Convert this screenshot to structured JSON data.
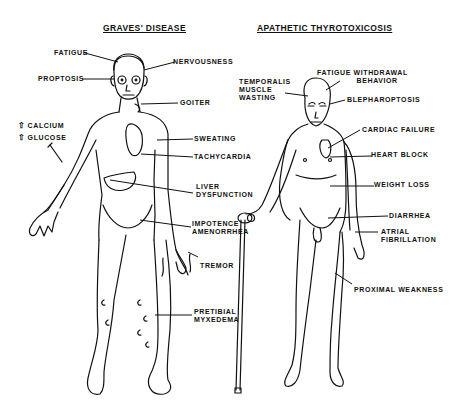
{
  "figures": [
    {
      "title": "GRAVES' DISEASE",
      "labels": {
        "fatigue": "FATIGUE",
        "nervousness": "NERVOUSNESS",
        "proptosis": "PROPTOSIS",
        "goiter": "GOITER",
        "calcium": "CALCIUM",
        "glucose": "GLUCOSE",
        "sweating": "SWEATING",
        "tachycardia": "TACHYCARDIA",
        "liver_1": "LIVER",
        "liver_2": "DYSFUNCTION",
        "impotence": "IMPOTENCE",
        "amenorrhea": "AMENORRHEA",
        "tremor": "TREMOR",
        "pretibial_1": "PRETIBIAL",
        "pretibial_2": "MYXEDEMA"
      },
      "indicators": {
        "calcium": "up-arrow-icon",
        "glucose": "up-arrow-icon"
      }
    },
    {
      "title": "APATHETIC THYROTOXICOSIS",
      "labels": {
        "temporalis_1": "TEMPORALIS",
        "temporalis_2": "MUSCLE",
        "temporalis_3": "WASTING",
        "fatigue_1": "FATIGUE WITHDRAWAL",
        "fatigue_2": "BEHAVIOR",
        "blepharoptosis": "BLEPHAROPTOSIS",
        "cardiac_failure": "CARDIAC FAILURE",
        "heart_block": "HEART BLOCK",
        "weight_loss": "WEIGHT LOSS",
        "diarrhea": "DIARRHEA",
        "atrial_1": "ATRIAL",
        "atrial_2": "FIBRILLATION",
        "proximal_weakness": "PROXIMAL WEAKNESS"
      }
    }
  ],
  "icons": {
    "up_arrow": "⇧"
  }
}
